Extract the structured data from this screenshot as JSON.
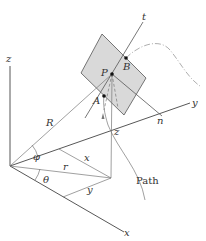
{
  "diagram": {
    "type": "3d-coordinate-geometry",
    "labels": {
      "z_axis": "z",
      "y_axis": "y",
      "x_axis": "x",
      "tangent": "t",
      "normal": "n",
      "point_p": "P",
      "point_a": "A",
      "point_b": "B",
      "radius_spherical": "R",
      "radius_cylindrical": "r",
      "coord_x": "x",
      "coord_y": "y",
      "coord_z": "z",
      "angle_phi": "φ",
      "angle_theta": "θ",
      "path": "Path"
    },
    "colors": {
      "plane_fill": "#d9d9d9",
      "plane_stroke": "#555555",
      "line": "#555555",
      "text": "#333333"
    }
  }
}
